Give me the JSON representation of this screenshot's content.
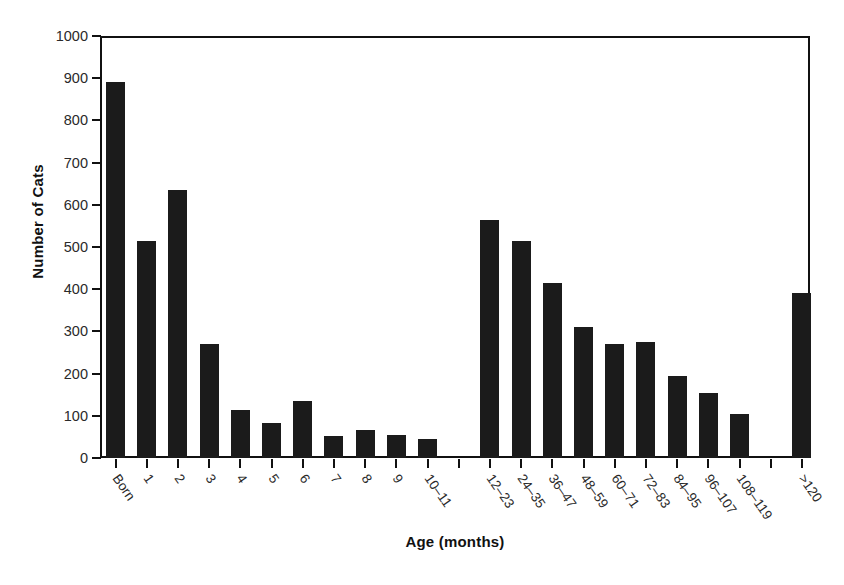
{
  "chart_data": {
    "type": "bar",
    "title": "",
    "xlabel": "Age (months)",
    "ylabel": "Number of Cats",
    "ylim": [
      0,
      1000
    ],
    "ytick_values": [
      0,
      100,
      200,
      300,
      400,
      500,
      600,
      700,
      800,
      900,
      1000
    ],
    "ytick_labels": [
      "0",
      "100",
      "200",
      "300",
      "400",
      "500",
      "600",
      "700",
      "800",
      "900",
      "1000"
    ],
    "grid": false,
    "legend": null,
    "bar_color": "#1b1b1b",
    "categories": [
      "Born",
      "1",
      "2",
      "3",
      "4",
      "5",
      "6",
      "7",
      "8",
      "9",
      "10–11",
      "",
      "12–23",
      "24–35",
      "36–47",
      "48–59",
      "60–71",
      "72–83",
      "84–95",
      "96–107",
      "108–119",
      "",
      ">120"
    ],
    "values": [
      890,
      515,
      635,
      270,
      113,
      82,
      136,
      52,
      66,
      55,
      46,
      null,
      565,
      515,
      414,
      310,
      271,
      275,
      194,
      155,
      105,
      null,
      390
    ],
    "bars": [
      {
        "label": "Born",
        "value": 890
      },
      {
        "label": "1",
        "value": 515
      },
      {
        "label": "2",
        "value": 635
      },
      {
        "label": "3",
        "value": 270
      },
      {
        "label": "4",
        "value": 113
      },
      {
        "label": "5",
        "value": 82
      },
      {
        "label": "6",
        "value": 136
      },
      {
        "label": "7",
        "value": 52
      },
      {
        "label": "8",
        "value": 66
      },
      {
        "label": "9",
        "value": 55
      },
      {
        "label": "10–11",
        "value": 46
      },
      {
        "label": "",
        "value": null
      },
      {
        "label": "12–23",
        "value": 565
      },
      {
        "label": "24–35",
        "value": 515
      },
      {
        "label": "36–47",
        "value": 414
      },
      {
        "label": "48–59",
        "value": 310
      },
      {
        "label": "60–71",
        "value": 271
      },
      {
        "label": "72–83",
        "value": 275
      },
      {
        "label": "84–95",
        "value": 194
      },
      {
        "label": "96–107",
        "value": 155
      },
      {
        "label": "108–119",
        "value": 105
      },
      {
        "label": "",
        "value": null
      },
      {
        "label": ">120",
        "value": 390
      }
    ]
  },
  "axes": {
    "y_title": "Number of Cats",
    "x_title": "Age (months)"
  }
}
